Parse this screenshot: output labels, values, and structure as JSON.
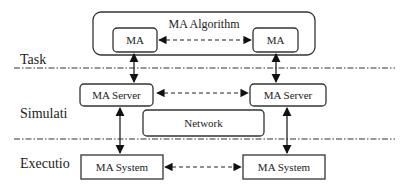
{
  "diagram": {
    "group": {
      "label": "MA Algorithm"
    },
    "layers": [
      {
        "label": "Task"
      },
      {
        "label": "Simulati"
      },
      {
        "label": "Executio"
      }
    ],
    "nodes": {
      "ma_left": "MA",
      "ma_right": "MA",
      "server_left": "MA Server",
      "server_right": "MA Server",
      "network": "Network",
      "system_left": "MA System",
      "system_right": "MA System"
    },
    "edges": [
      {
        "from": "ma_left",
        "to": "ma_right",
        "style": "dashed",
        "direction": "both"
      },
      {
        "from": "ma_left",
        "to": "server_left",
        "style": "solid",
        "direction": "both"
      },
      {
        "from": "ma_right",
        "to": "server_right",
        "style": "solid",
        "direction": "both"
      },
      {
        "from": "server_left",
        "to": "server_right",
        "style": "dashed",
        "direction": "both"
      },
      {
        "from": "server_left",
        "to": "system_left",
        "style": "solid",
        "direction": "both"
      },
      {
        "from": "server_right",
        "to": "system_right",
        "style": "solid",
        "direction": "both"
      },
      {
        "from": "system_left",
        "to": "system_right",
        "style": "dashed",
        "direction": "both"
      }
    ]
  }
}
